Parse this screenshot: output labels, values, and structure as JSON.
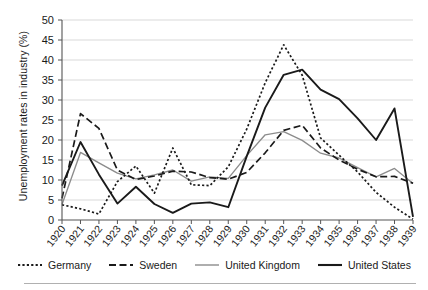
{
  "axes": {
    "ylabel": "Unemployment rates in industry (%)",
    "xlabel": "",
    "y_ticks": [
      "0",
      "5",
      "10",
      "15",
      "20",
      "25",
      "30",
      "35",
      "40",
      "45",
      "50"
    ],
    "x_ticks": [
      "1920",
      "1921",
      "1922",
      "1923",
      "1924",
      "1925",
      "1926",
      "1927",
      "1928",
      "1929",
      "1930",
      "1931",
      "1932",
      "1933",
      "1934",
      "1935",
      "1936",
      "1937",
      "1938",
      "1939"
    ]
  },
  "legend": {
    "position": "bottom",
    "items": [
      {
        "label": "Germany",
        "style": "dotted",
        "color": "#1a1a1a"
      },
      {
        "label": "Sweden",
        "style": "dashed",
        "color": "#1a1a1a"
      },
      {
        "label": "United Kingdom",
        "style": "solid-thin",
        "color": "#8c8c8c"
      },
      {
        "label": "United States",
        "style": "solid-thick",
        "color": "#1a1a1a"
      }
    ]
  },
  "chart_data": {
    "type": "line",
    "title": "",
    "xlabel": "",
    "ylabel": "Unemployment rates in industry (%)",
    "x": [
      1920,
      1921,
      1922,
      1923,
      1924,
      1925,
      1926,
      1927,
      1928,
      1929,
      1930,
      1931,
      1932,
      1933,
      1934,
      1935,
      1936,
      1937,
      1938,
      1939
    ],
    "xlim": [
      1920,
      1939
    ],
    "ylim": [
      0,
      50
    ],
    "ytick_step": 5,
    "grid": true,
    "series": [
      {
        "name": "Germany",
        "color": "#1a1a1a",
        "style": "dotted",
        "values": [
          3.8,
          2.8,
          1.5,
          9.6,
          13.5,
          6.7,
          18.0,
          8.8,
          8.6,
          13.3,
          22.7,
          34.3,
          43.8,
          36.2,
          20.5,
          16.2,
          12.0,
          6.9,
          3.2,
          0.2
        ]
      },
      {
        "name": "Sweden",
        "color": "#1a1a1a",
        "style": "dashed",
        "values": [
          5.4,
          26.6,
          22.9,
          12.5,
          10.1,
          11.0,
          12.2,
          12.0,
          10.6,
          10.2,
          11.9,
          16.8,
          22.4,
          23.7,
          18.0,
          15.0,
          12.7,
          10.8,
          10.9,
          9.2
        ]
      },
      {
        "name": "United Kingdom",
        "color": "#8c8c8c",
        "style": "solid-thin",
        "values": [
          3.9,
          16.9,
          14.3,
          11.7,
          10.3,
          11.3,
          12.5,
          9.7,
          10.8,
          10.4,
          16.1,
          21.3,
          22.1,
          19.9,
          16.7,
          15.5,
          13.1,
          10.8,
          12.9,
          9.1
        ]
      },
      {
        "name": "United States",
        "color": "#1a1a1a",
        "style": "solid-thick",
        "values": [
          8.6,
          19.5,
          11.4,
          4.1,
          8.3,
          4.0,
          1.8,
          4.1,
          4.4,
          3.2,
          15.9,
          28.1,
          36.3,
          37.6,
          32.6,
          30.2,
          25.4,
          20.0,
          27.9,
          0.8
        ]
      }
    ]
  }
}
